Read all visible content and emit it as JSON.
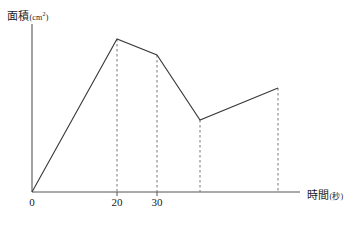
{
  "chart_data": {
    "type": "line",
    "title": "",
    "xlabel": "時間(秒)",
    "ylabel": "面積(cm²)",
    "ylabel_main": "面積",
    "ylabel_unit": "cm",
    "ylabel_unit_sup": "2",
    "xlabel_main": "時間",
    "xlabel_unit": "(秒)",
    "x_tick_labels": [
      "0",
      "20",
      "30"
    ],
    "x_tick_values": [
      0,
      20,
      30
    ],
    "grid": false,
    "legend": false,
    "axis_arrow": false,
    "x": [
      0,
      20,
      30,
      41,
      60
    ],
    "y": [
      0,
      100,
      89.5,
      47,
      68
    ],
    "vertices": [
      {
        "label": "origin",
        "x": 0,
        "y": 0,
        "px": 32,
        "py": 192
      },
      {
        "label": "peak",
        "x": 20,
        "y": 100,
        "px": 117,
        "py": 39
      },
      {
        "label": "second-bend",
        "x": 30,
        "y": 89.5,
        "px": 157,
        "py": 55
      },
      {
        "label": "valley",
        "x": 41,
        "y": 47,
        "px": 200,
        "py": 120
      },
      {
        "label": "end",
        "x": 60,
        "y": 68,
        "px": 278,
        "py": 88
      }
    ],
    "dashed_drop_lines_px": [
      117,
      157,
      200,
      278
    ],
    "x_tick_px": [
      32,
      117,
      157
    ],
    "axis_origin_px": {
      "x": 32,
      "y": 192
    },
    "x_axis_end_px": 300,
    "y_axis_top_px": 24,
    "colors": {
      "line": "#3a3a3a",
      "axis": "#555555",
      "dashed": "#777777",
      "text": "#1a1a1a",
      "background": "#ffffff"
    }
  }
}
